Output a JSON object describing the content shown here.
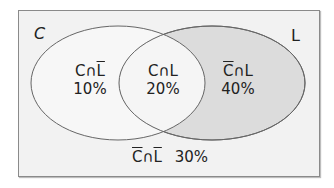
{
  "diagram": {
    "type": "venn",
    "sets": [
      {
        "name": "C"
      },
      {
        "name": "L"
      }
    ],
    "regions": [
      {
        "id": "c-only",
        "label_parts": [
          "C",
          "∩",
          "L"
        ],
        "overline": [
          false,
          false,
          true
        ],
        "value": "10%"
      },
      {
        "id": "both",
        "label_parts": [
          "C",
          "∩",
          "L"
        ],
        "overline": [
          false,
          false,
          false
        ],
        "value": "20%"
      },
      {
        "id": "l-only",
        "label_parts": [
          "C",
          "∩",
          "L"
        ],
        "overline": [
          true,
          false,
          false
        ],
        "value": "40%"
      },
      {
        "id": "neither",
        "label_parts": [
          "C",
          "∩",
          "L"
        ],
        "overline": [
          true,
          false,
          true
        ],
        "value": "30%"
      }
    ],
    "colors": {
      "background": "#f2f2f2",
      "left_fill": "#f7f7f7",
      "right_fill": "#dcdcdc",
      "stroke": "#666666"
    }
  }
}
